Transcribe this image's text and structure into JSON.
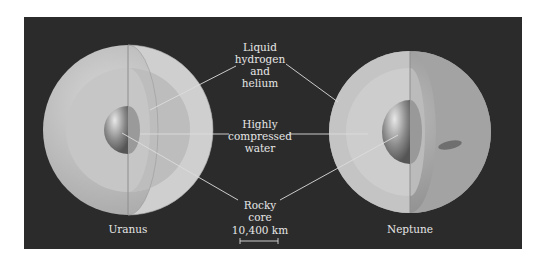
{
  "labels": {
    "liquid": [
      "Liquid",
      "hydrogen",
      "and",
      "helium"
    ],
    "water": [
      "Highly",
      "compressed",
      "water"
    ],
    "core": [
      "Rocky",
      "core"
    ],
    "scale": "10,400 km"
  },
  "planets": {
    "left": "Uranus",
    "right": "Neptune"
  },
  "colors": {
    "background": "#2b2b2b",
    "text": "#e6e6e6"
  }
}
